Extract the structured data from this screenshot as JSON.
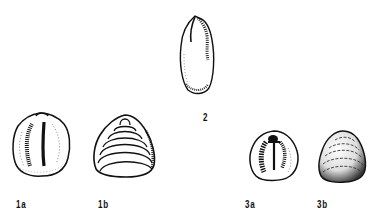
{
  "plate": {
    "figures": [
      {
        "id": "1a",
        "label": "1a",
        "view": "interior"
      },
      {
        "id": "1b",
        "label": "1b",
        "view": "exterior"
      },
      {
        "id": "2",
        "label": "2",
        "view": "elongate"
      },
      {
        "id": "3a",
        "label": "3a",
        "view": "interior"
      },
      {
        "id": "3b",
        "label": "3b",
        "view": "exterior"
      }
    ]
  }
}
